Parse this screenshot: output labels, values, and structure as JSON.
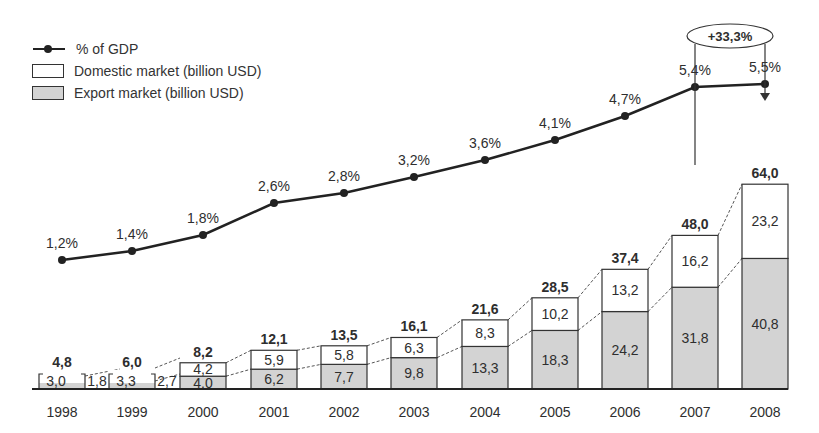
{
  "legend": {
    "line_label": "% of GDP",
    "domestic_label": "Domestic market (billion USD)",
    "export_label": "Export market (billion USD)"
  },
  "annotation": {
    "growth_label": "+33,3%"
  },
  "colors": {
    "export_fill": "#d3d3d3",
    "domestic_fill": "#ffffff",
    "line": "#222222"
  },
  "chart_data": {
    "type": "bar",
    "title": "",
    "xlabel": "",
    "ylabel": "",
    "categories": [
      "1998",
      "1999",
      "2000",
      "2001",
      "2002",
      "2003",
      "2004",
      "2005",
      "2006",
      "2007",
      "2008"
    ],
    "series": [
      {
        "name": "Export market (billion USD)",
        "kind": "stacked-bar",
        "values": [
          1.8,
          2.7,
          4.0,
          6.2,
          7.7,
          9.8,
          13.3,
          18.3,
          24.2,
          31.8,
          40.8
        ],
        "labels": [
          "1,8",
          "2,7",
          "4,0",
          "6,2",
          "7,7",
          "9,8",
          "13,3",
          "18,3",
          "24,2",
          "31,8",
          "40,8"
        ]
      },
      {
        "name": "Domestic market (billion USD)",
        "kind": "stacked-bar",
        "values": [
          3.0,
          3.3,
          4.2,
          5.9,
          5.8,
          6.3,
          8.3,
          10.2,
          13.2,
          16.2,
          23.2
        ],
        "labels": [
          "3,0",
          "3,3",
          "4,2",
          "5,9",
          "5,8",
          "6,3",
          "8,3",
          "10,2",
          "13,2",
          "16,2",
          "23,2"
        ]
      },
      {
        "name": "% of GDP",
        "kind": "line",
        "values": [
          1.2,
          1.4,
          1.8,
          2.6,
          2.8,
          3.2,
          3.6,
          4.1,
          4.7,
          5.4,
          5.5
        ],
        "labels": [
          "1,2%",
          "1,4%",
          "1,8%",
          "2,6%",
          "2,8%",
          "3,2%",
          "3,6%",
          "4,1%",
          "4,7%",
          "5,4%",
          "5,5%"
        ]
      }
    ],
    "totals": [
      4.8,
      6.0,
      8.2,
      12.1,
      13.5,
      16.1,
      21.6,
      28.5,
      37.4,
      48.0,
      64.0
    ],
    "total_labels": [
      "4,8",
      "6,0",
      "8,2",
      "12,1",
      "13,5",
      "16,1",
      "21,6",
      "28,5",
      "37,4",
      "48,0",
      "64,0"
    ],
    "annotations": [
      "+33,3% (2007 to 2008 total market growth)"
    ],
    "legend_position": "top-left",
    "grid": false
  }
}
